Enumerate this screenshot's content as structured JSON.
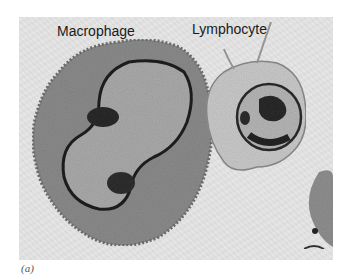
{
  "figure": {
    "labels": {
      "left_cell": "Macrophage",
      "right_cell": "Lymphocyte"
    },
    "panel_caption": "(a)",
    "colors": {
      "background": "#e4e4e4",
      "macrophage_cytoplasm": "#8a8a8a",
      "macrophage_nucleus": "#a9a9a9",
      "lymphocyte_cytoplasm": "#c8c8c8",
      "lymphocyte_nucleus": "#b4b4b4",
      "chromatin": "#2a2a2a"
    }
  }
}
